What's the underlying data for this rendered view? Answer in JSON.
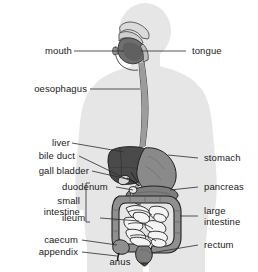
{
  "figure": {
    "background_color": "#ffffff",
    "body_silhouette_color": "#e4e4e4",
    "organ_dark_color": "#4a4a4a",
    "organ_mid_color": "#8a8a8a",
    "organ_light_color": "#b5b5b5",
    "organ_pale_color": "#f2f2f2",
    "outline_color": "#2b2b2b",
    "leader_line_color": "#2b2b2b",
    "text_color": "#1a1a1a"
  },
  "labels_left": [
    {
      "id": "mouth",
      "text": "mouth"
    },
    {
      "id": "oesophagus",
      "text": "oesophagus"
    },
    {
      "id": "liver",
      "text": "liver"
    },
    {
      "id": "bile-duct",
      "text": "bile duct"
    },
    {
      "id": "gall-bladder",
      "text": "gall bladder"
    },
    {
      "id": "duodenum",
      "text": "duodenum"
    },
    {
      "id": "small-intestine-line1",
      "text": "small"
    },
    {
      "id": "small-intestine-line2",
      "text": "intestine"
    },
    {
      "id": "ileum",
      "text": "ileum"
    },
    {
      "id": "caecum",
      "text": "caecum"
    },
    {
      "id": "appendix",
      "text": "appendix"
    }
  ],
  "labels_right": [
    {
      "id": "tongue",
      "text": "tongue"
    },
    {
      "id": "stomach",
      "text": "stomach"
    },
    {
      "id": "pancreas",
      "text": "pancreas"
    },
    {
      "id": "large-intestine-line1",
      "text": "large"
    },
    {
      "id": "large-intestine-line2",
      "text": "intestine"
    },
    {
      "id": "rectum",
      "text": "rectum"
    }
  ],
  "labels_bottom": [
    {
      "id": "anus",
      "text": "anus"
    }
  ],
  "grouping": {
    "small_intestine_bracket": "small intestine groups duodenum and ileum"
  }
}
